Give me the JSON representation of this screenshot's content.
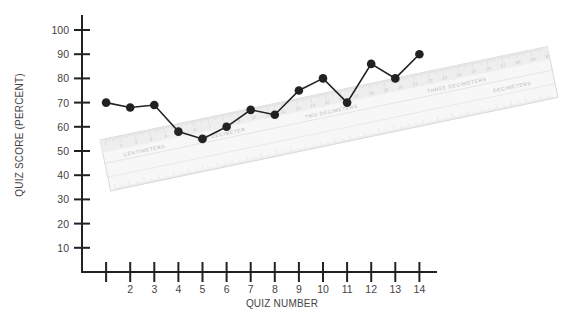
{
  "chart_data": {
    "type": "line",
    "title": "",
    "xlabel": "QUIZ NUMBER",
    "ylabel": "QUIZ SCORE (PERCENT)",
    "x": [
      1,
      2,
      3,
      4,
      5,
      6,
      7,
      8,
      9,
      10,
      11,
      12,
      13,
      14
    ],
    "x_tick_labels": [
      "",
      "2",
      "3",
      "4",
      "5",
      "6",
      "7",
      "8",
      "9",
      "10",
      "11",
      "12",
      "13",
      "14"
    ],
    "y_ticks": [
      10,
      20,
      30,
      40,
      50,
      60,
      70,
      80,
      90,
      100
    ],
    "ylim": [
      0,
      100
    ],
    "xlim": [
      0,
      14
    ],
    "grid": false,
    "legend": null,
    "series": [
      {
        "name": "Quiz score",
        "color": "#222222",
        "values": [
          70,
          68,
          69,
          58,
          55,
          60,
          67,
          65,
          75,
          80,
          70,
          86,
          80,
          90
        ]
      }
    ],
    "annotations": [
      {
        "type": "image-overlay",
        "description": "Faded metric ruler laid diagonally across the plot",
        "labels": [
          "CENTIMETERS",
          "ONE DECIMETER",
          "TWO DECIMETERS",
          "THREE DECIMETERS"
        ]
      }
    ]
  },
  "ruler": {
    "labels": {
      "centimeters": "CENTIMETERS",
      "one_dm": "ONE DECIMETER",
      "two_dm": "TWO DECIMETERS",
      "three_dm": "THREE DECIMETERS",
      "mirrored": "DECIMETERS"
    }
  }
}
